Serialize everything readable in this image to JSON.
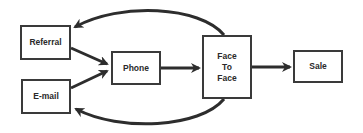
{
  "diagram": {
    "type": "flowchart",
    "colors": {
      "stroke": "#2d2d2d",
      "box_border": "#3a3a3a",
      "text": "#2a2a2a",
      "background": "#ffffff"
    },
    "nodes": [
      {
        "id": "referral",
        "label": "Referral",
        "x": 20,
        "y": 25,
        "w": 51,
        "h": 35
      },
      {
        "id": "email",
        "label": "E-mail",
        "x": 21,
        "y": 79,
        "w": 50,
        "h": 35
      },
      {
        "id": "phone",
        "label": "Phone",
        "x": 111,
        "y": 51,
        "w": 50,
        "h": 34
      },
      {
        "id": "face_to_face",
        "label": "Face\nTo\nFace",
        "x": 202,
        "y": 35,
        "w": 50,
        "h": 64
      },
      {
        "id": "sale",
        "label": "Sale",
        "x": 293,
        "y": 50,
        "w": 50,
        "h": 33
      }
    ],
    "edges": [
      {
        "from": "referral",
        "to": "phone",
        "shape": "straight"
      },
      {
        "from": "email",
        "to": "phone",
        "shape": "straight"
      },
      {
        "from": "phone",
        "to": "face_to_face",
        "shape": "straight"
      },
      {
        "from": "face_to_face",
        "to": "sale",
        "shape": "straight"
      },
      {
        "from": "face_to_face",
        "to": "referral",
        "shape": "curved-top"
      },
      {
        "from": "face_to_face",
        "to": "email",
        "shape": "curved-bottom"
      }
    ]
  }
}
